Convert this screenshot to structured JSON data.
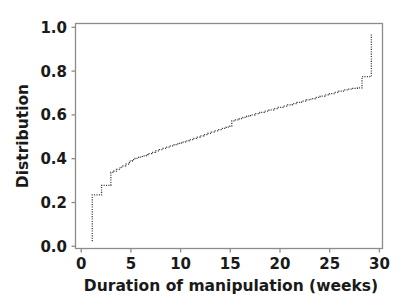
{
  "chart_data": {
    "type": "line",
    "subtype": "empirical-cdf-step",
    "title": "",
    "subtitle": "",
    "xlabel": "Duration of manipulation (weeks)",
    "ylabel": "Distribution",
    "xlim": [
      -0.8,
      32.2
    ],
    "ylim": [
      -0.035,
      1.045
    ],
    "xticks": [
      0,
      5,
      10,
      15,
      20,
      25,
      30
    ],
    "xticklabels": [
      "0",
      "5",
      "10",
      "15",
      "20",
      "25",
      "30"
    ],
    "yticks": [
      0.0,
      0.2,
      0.4,
      0.6,
      0.8,
      1.0
    ],
    "yticklabels": [
      "0.0",
      "0.2",
      "0.4",
      "0.6",
      "0.8",
      "1.0"
    ],
    "grid": false,
    "legend": null,
    "legend_position": "none",
    "line_color": "#3a3a3a",
    "line_style": "dotted",
    "frame_color": "#8c8c8c",
    "background_color": "#ffffff",
    "annotations": [],
    "series": [
      {
        "name": "Distribution",
        "x": [
          1.0,
          1.0,
          1.4,
          1.8,
          2.0,
          2.3,
          2.6,
          3.0,
          3.3,
          3.6,
          4.0,
          4.3,
          4.6,
          5.0,
          5.3,
          5.6,
          6.0,
          6.4,
          6.8,
          7.0,
          7.4,
          7.8,
          8.2,
          8.6,
          9.0,
          9.4,
          9.8,
          10.2,
          10.6,
          11.0,
          11.4,
          11.8,
          12.2,
          12.6,
          13.0,
          13.4,
          13.8,
          14.2,
          14.6,
          15.0,
          15.4,
          15.8,
          16.0,
          16.4,
          16.8,
          17.2,
          17.6,
          18.0,
          18.5,
          19.0,
          19.5,
          20.0,
          20.5,
          21.0,
          21.5,
          22.0,
          22.5,
          23.0,
          23.5,
          24.0,
          24.5,
          25.0,
          25.5,
          26.0,
          26.5,
          27.0,
          27.5,
          28.0,
          28.5,
          29.0,
          29.5,
          30.0,
          30.3,
          31.0,
          31.0
        ],
        "y": [
          0.0,
          0.222,
          0.222,
          0.222,
          0.268,
          0.268,
          0.268,
          0.33,
          0.336,
          0.345,
          0.356,
          0.362,
          0.37,
          0.385,
          0.392,
          0.398,
          0.404,
          0.41,
          0.416,
          0.421,
          0.427,
          0.434,
          0.44,
          0.446,
          0.452,
          0.458,
          0.464,
          0.47,
          0.476,
          0.482,
          0.488,
          0.494,
          0.5,
          0.506,
          0.512,
          0.518,
          0.524,
          0.53,
          0.536,
          0.542,
          0.548,
          0.552,
          0.578,
          0.582,
          0.588,
          0.594,
          0.6,
          0.606,
          0.612,
          0.618,
          0.624,
          0.63,
          0.636,
          0.642,
          0.648,
          0.654,
          0.66,
          0.666,
          0.672,
          0.678,
          0.684,
          0.69,
          0.696,
          0.702,
          0.708,
          0.714,
          0.72,
          0.726,
          0.73,
          0.734,
          0.736,
          0.79,
          0.79,
          0.79,
          1.0
        ]
      }
    ]
  },
  "axes": {
    "ylabel": "Distribution",
    "xlabel": "Duration of manipulation (weeks)",
    "xticklabels": [
      "0",
      "5",
      "10",
      "15",
      "20",
      "25",
      "30"
    ],
    "yticklabels": [
      "0.0",
      "0.2",
      "0.4",
      "0.6",
      "0.8",
      "1.0"
    ]
  }
}
